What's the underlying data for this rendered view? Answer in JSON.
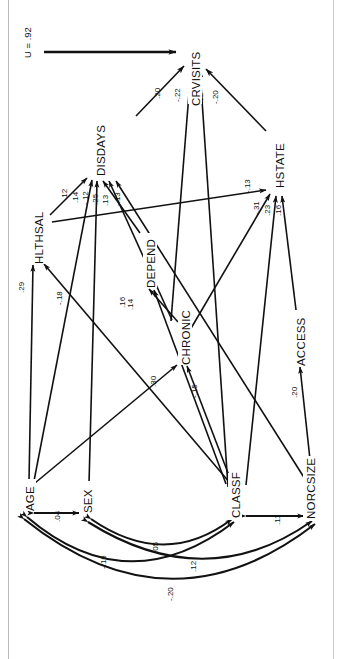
{
  "figure": {
    "type": "path-diagram",
    "orientation": "rotated-90-ccw",
    "disturbance": {
      "label": "U = .92",
      "target": "CRVISITS"
    }
  },
  "nodes": {
    "CRVISITS": {
      "label": "CRVISITS",
      "x": 196,
      "y": 52,
      "role": "outcome"
    },
    "DISDAYS": {
      "label": "DISDAYS",
      "x": 100,
      "y": 148,
      "role": "mediator"
    },
    "HSTATE": {
      "label": "HSTATE",
      "x": 279,
      "y": 163,
      "role": "mediator"
    },
    "HLTHSAL": {
      "label": "HLTHSAL",
      "x": 38,
      "y": 235,
      "role": "mediator"
    },
    "DEPEND": {
      "label": "DEPEND",
      "x": 151,
      "y": 258,
      "role": "mediator"
    },
    "CHRONIC": {
      "label": "CHRONIC",
      "x": 185,
      "y": 337,
      "role": "mediator"
    },
    "ACCESS": {
      "label": "ACCESS",
      "x": 300,
      "y": 337,
      "role": "mediator"
    },
    "AGE": {
      "label": "AGE",
      "x": 20,
      "y": 498,
      "role": "exogenous"
    },
    "SEX": {
      "label": "SEX",
      "x": 93,
      "y": 500,
      "role": "exogenous"
    },
    "CLASSF": {
      "label": "CLASSF",
      "x": 237,
      "y": 502,
      "role": "exogenous"
    },
    "NORCSIZE": {
      "label": "NORCSIZE",
      "x": 317,
      "y": 500,
      "role": "exogenous"
    }
  },
  "paths": [
    {
      "from": "DISDAYS",
      "to": "CRVISITS",
      "coef": ".20"
    },
    {
      "from": "CHRONIC",
      "to": "CRVISITS",
      "coef": "-.22"
    },
    {
      "from": "CLASSF",
      "to": "CRVISITS",
      "coef": ".12"
    },
    {
      "from": "HSTATE",
      "to": "CRVISITS",
      "coef": "-.20"
    },
    {
      "from": "HLTHSAL",
      "to": "DISDAYS",
      "coef": ".12"
    },
    {
      "from": "AGE",
      "to": "DISDAYS",
      "coef": ".14"
    },
    {
      "from": "SEX",
      "to": "DISDAYS",
      "coef": "-.12"
    },
    {
      "from": "DEPEND",
      "to": "DISDAYS",
      "coef": ".25"
    },
    {
      "from": "CHRONIC",
      "to": "DISDAYS",
      "coef": ".13"
    },
    {
      "from": "NORCSIZE",
      "to": "DISDAYS",
      "coef": "-.13"
    },
    {
      "from": "HLTHSAL",
      "to": "HSTATE",
      "coef": "-.13"
    },
    {
      "from": "CHRONIC",
      "to": "HSTATE",
      "coef": "-.31"
    },
    {
      "from": "CLASSF",
      "to": "HSTATE",
      "coef": ".23"
    },
    {
      "from": "ACCESS",
      "to": "HSTATE",
      "coef": ".16"
    },
    {
      "from": "AGE",
      "to": "HLTHSAL",
      "coef": ".29"
    },
    {
      "from": "CLASSF",
      "to": "HLTHSAL",
      "coef": "-.18"
    },
    {
      "from": "CHRONIC",
      "to": "DEPEND",
      "coef": ".16"
    },
    {
      "from": "CLASSF",
      "to": "DEPEND",
      "coef": ".14"
    },
    {
      "from": "AGE",
      "to": "CHRONIC",
      "coef": ".30"
    },
    {
      "from": "CLASSF",
      "to": "CHRONIC",
      "coef": "-.15"
    },
    {
      "from": "NORCSIZE",
      "to": "ACCESS",
      "coef": ".20"
    }
  ],
  "correlations": [
    {
      "a": "AGE",
      "b": "SEX",
      "coef": ".04"
    },
    {
      "a": "SEX",
      "b": "CLASSF",
      "coef": ".05"
    },
    {
      "a": "AGE",
      "b": "CLASSF",
      "coef": "-.16"
    },
    {
      "a": "SEX",
      "b": "NORCSIZE",
      "coef": ".12"
    },
    {
      "a": "AGE",
      "b": "NORCSIZE",
      "coef": "-.20"
    },
    {
      "a": "CLASSF",
      "b": "NORCSIZE",
      "coef": ".11"
    }
  ],
  "colors": {
    "ink": "#111111",
    "paper": "#ffffff",
    "edge": "#b9b9b9"
  }
}
